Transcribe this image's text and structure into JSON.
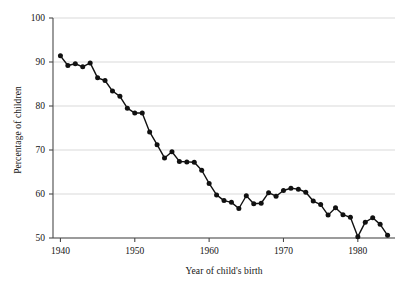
{
  "chart_data": {
    "type": "line",
    "title": "",
    "subtitle": "",
    "xlabel": "Year of child's birth",
    "ylabel": "Percentage of children",
    "xlim": [
      1939,
      1985
    ],
    "ylim": [
      50,
      100
    ],
    "xticks": [
      1940,
      1950,
      1960,
      1970,
      1980
    ],
    "xtick_labels": [
      "1940",
      "1950",
      "1960",
      "1970",
      "1980"
    ],
    "yticks": [
      50,
      60,
      70,
      80,
      90,
      100
    ],
    "ytick_labels": [
      "50",
      "60",
      "70",
      "80",
      "90",
      "100"
    ],
    "grid": "horizontal",
    "legend": "none",
    "marker": "filled-circle",
    "line_color": "#111111",
    "marker_color": "#111111",
    "grid_color": "#d9d9d9",
    "axis_color": "#4a4a4a",
    "x": [
      1940,
      1941,
      1942,
      1943,
      1944,
      1945,
      1946,
      1947,
      1948,
      1949,
      1950,
      1951,
      1952,
      1953,
      1954,
      1955,
      1956,
      1957,
      1958,
      1959,
      1960,
      1961,
      1962,
      1963,
      1964,
      1965,
      1966,
      1967,
      1968,
      1969,
      1970,
      1971,
      1972,
      1973,
      1974,
      1975,
      1976,
      1977,
      1978,
      1979,
      1980,
      1981,
      1982,
      1983,
      1984
    ],
    "values": [
      91.4,
      89.2,
      89.6,
      88.9,
      89.8,
      86.4,
      85.8,
      83.4,
      82.2,
      79.5,
      78.4,
      78.4,
      74.1,
      71.2,
      68.2,
      69.6,
      67.4,
      67.3,
      67.2,
      65.4,
      62.4,
      59.8,
      58.5,
      58.1,
      56.7,
      59.6,
      57.8,
      57.9,
      60.3,
      59.5,
      60.8,
      61.3,
      61.1,
      60.4,
      58.4,
      57.6,
      55.2,
      56.9,
      55.3,
      54.7,
      50.3,
      53.6,
      54.6,
      53.1,
      50.6
    ]
  },
  "plot_geometry": {
    "left": 53,
    "right": 395,
    "top": 18,
    "bottom": 238
  }
}
